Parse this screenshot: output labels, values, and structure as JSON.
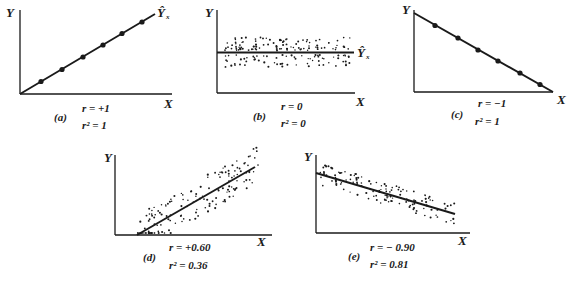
{
  "chart_data": [
    {
      "type": "scatter",
      "panel": "(a)",
      "title": "",
      "xlabel": "X",
      "ylabel": "Y",
      "line_label": "Ŷ",
      "line_label_sub": "x",
      "r_label": "r = +1",
      "r2_label": "r² = 1",
      "r": 1,
      "r2": 1,
      "points": [
        [
          1,
          1
        ],
        [
          2,
          2
        ],
        [
          3,
          3
        ],
        [
          4,
          4
        ],
        [
          5,
          5
        ],
        [
          6,
          6
        ]
      ],
      "fit": {
        "slope": 1,
        "intercept": 0
      },
      "grid": false
    },
    {
      "type": "scatter",
      "panel": "(b)",
      "xlabel": "X",
      "ylabel": "Y",
      "line_label": "Ŷ",
      "line_label_sub": "x",
      "r_label": "r = 0",
      "r2_label": "r² = 0",
      "r": 0,
      "r2": 0,
      "description": "Uniform band of points scattered around a horizontal regression line",
      "fit": {
        "slope": 0,
        "intercept": "mean(Y)"
      },
      "grid": false
    },
    {
      "type": "scatter",
      "panel": "(c)",
      "xlabel": "X",
      "ylabel": "Y",
      "r_label": "r = −1",
      "r2_label": "r² = 1",
      "r": -1,
      "r2": 1,
      "points": [
        [
          1,
          6
        ],
        [
          2,
          5
        ],
        [
          3,
          4
        ],
        [
          4,
          3
        ],
        [
          5,
          2
        ],
        [
          6,
          1
        ]
      ],
      "fit": {
        "slope": -1
      },
      "grid": false
    },
    {
      "type": "scatter",
      "panel": "(d)",
      "xlabel": "X",
      "ylabel": "Y",
      "r_label": "r = +0.60",
      "r2_label": "r² = 0.36",
      "r": 0.6,
      "r2": 0.36,
      "description": "Wide band of points around a positively sloped regression line",
      "grid": false
    },
    {
      "type": "scatter",
      "panel": "(e)",
      "xlabel": "X",
      "ylabel": "Y",
      "r_label": "r = −0.90",
      "r2_label": "r² = 0.81",
      "r": -0.9,
      "r2": 0.81,
      "description": "Narrow band of points around a negatively sloped regression line",
      "grid": false
    }
  ],
  "panels": {
    "a": {
      "tag": "(a)",
      "r": "r  =  +1",
      "r2": "r² = 1",
      "x": "X",
      "y": "Y",
      "yhat": "Ŷ",
      "sub": "x"
    },
    "b": {
      "tag": "(b)",
      "r": "r  =  0",
      "r2": "r² = 0",
      "x": "X",
      "y": "Y",
      "yhat": "Ŷ",
      "sub": "x"
    },
    "c": {
      "tag": "(c)",
      "r": "r  =  −1",
      "r2": "r² = 1",
      "x": "X",
      "y": "Y"
    },
    "d": {
      "tag": "(d)",
      "r": "r  =  +0.60",
      "r2": "r² = 0.36",
      "x": "X",
      "y": "Y"
    },
    "e": {
      "tag": "(e)",
      "r": "r  =  − 0.90",
      "r2": "r² = 0.81",
      "x": "X",
      "y": "Y"
    }
  }
}
